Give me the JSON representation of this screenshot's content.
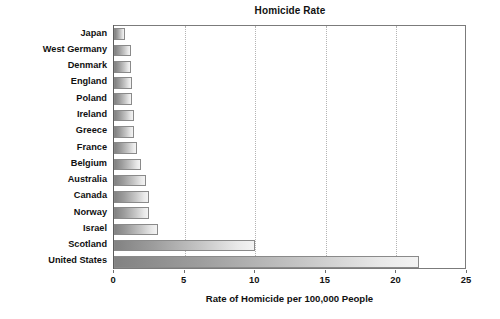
{
  "chart_data": {
    "type": "bar",
    "orientation": "horizontal",
    "title": "Homicide Rate",
    "xlabel": "Rate of Homicide per 100,000 People",
    "ylabel": "",
    "xlim": [
      0,
      25
    ],
    "xticks": [
      0,
      5,
      10,
      15,
      20,
      25
    ],
    "xtick_labels": [
      "0",
      "5",
      "10",
      "15",
      "20",
      "25"
    ],
    "grid": "vertical-dotted",
    "legend": null,
    "categories": [
      "Japan",
      "West Germany",
      "Denmark",
      "England",
      "Poland",
      "Ireland",
      "Greece",
      "France",
      "Belgium",
      "Australia",
      "Canada",
      "Norway",
      "Israel",
      "Scotland",
      "United States"
    ],
    "values": [
      0.8,
      1.2,
      1.2,
      1.3,
      1.3,
      1.4,
      1.4,
      1.6,
      1.9,
      2.3,
      2.5,
      2.5,
      3.1,
      10.0,
      21.6
    ],
    "bar_gradient": {
      "from": "#828282",
      "to": "#f3f3f3",
      "border": "#8a8a8a"
    },
    "axis_color": "#7b7b7b",
    "grid_color": "#b4b4b4",
    "background": "#ffffff"
  }
}
